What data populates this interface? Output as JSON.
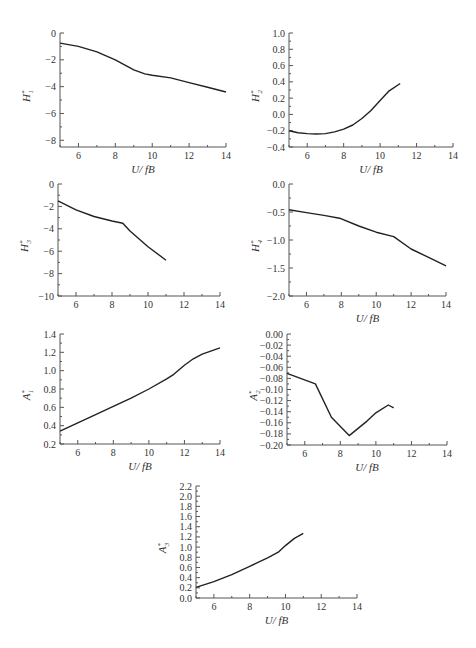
{
  "figure": {
    "xlabel": "U/ fB"
  },
  "chart_data": [
    {
      "id": "H1",
      "type": "line",
      "ylabel": "H*1",
      "ylabel_main": "H",
      "ylabel_sub": "1",
      "xlabel": "U/ fB",
      "xlim": [
        5,
        14
      ],
      "ylim": [
        -8.5,
        0
      ],
      "xticks": [
        6,
        8,
        10,
        12,
        14
      ],
      "yticks": [
        0,
        -2,
        -4,
        -6,
        -8
      ],
      "ytick_labels": [
        "0",
        "-2",
        "-4",
        "-6",
        "-8"
      ],
      "x": [
        5,
        6,
        7,
        8,
        9,
        9.6,
        10,
        11,
        12,
        13,
        14
      ],
      "y": [
        -0.75,
        -1.0,
        -1.4,
        -2.0,
        -2.75,
        -3.05,
        -3.15,
        -3.35,
        -3.7,
        -4.05,
        -4.4
      ],
      "grid": false
    },
    {
      "id": "H2",
      "type": "line",
      "ylabel": "H*2",
      "ylabel_main": "H",
      "ylabel_sub": "2",
      "xlabel": "U/ fB",
      "xlim": [
        5,
        14
      ],
      "ylim": [
        -0.4,
        1.0
      ],
      "xticks": [
        6,
        8,
        10,
        12,
        14
      ],
      "yticks": [
        1.0,
        0.8,
        0.6,
        0.4,
        0.2,
        0.0,
        -0.2,
        -0.4
      ],
      "ytick_labels": [
        "1.0",
        "0.8",
        "0.6",
        "0.4",
        "0.2",
        "0.0",
        "-0.2",
        "-0.4"
      ],
      "x": [
        5,
        5.5,
        6,
        6.5,
        7,
        7.5,
        8,
        8.5,
        9,
        9.5,
        10,
        10.5,
        11.1
      ],
      "y": [
        -0.2,
        -0.225,
        -0.235,
        -0.24,
        -0.235,
        -0.215,
        -0.18,
        -0.13,
        -0.05,
        0.05,
        0.17,
        0.29,
        0.38
      ],
      "grid": false
    },
    {
      "id": "H3",
      "type": "line",
      "ylabel": "H*3",
      "ylabel_main": "H",
      "ylabel_sub": "3",
      "xlabel": "",
      "xlim": [
        5,
        14
      ],
      "ylim": [
        -10,
        0
      ],
      "xticks": [
        6,
        8,
        10,
        12,
        14
      ],
      "yticks": [
        0,
        -2,
        -4,
        -6,
        -8,
        -10
      ],
      "ytick_labels": [
        "0",
        "-2",
        "-4",
        "-6",
        "-8",
        "-10"
      ],
      "x": [
        5,
        6,
        7,
        8,
        8.6,
        9,
        10,
        11
      ],
      "y": [
        -1.5,
        -2.3,
        -2.9,
        -3.3,
        -3.5,
        -4.2,
        -5.6,
        -6.8
      ],
      "grid": false
    },
    {
      "id": "H4",
      "type": "line",
      "ylabel": "H*4",
      "ylabel_main": "H",
      "ylabel_sub": "4",
      "xlabel": "U/ fB",
      "xlim": [
        5,
        14
      ],
      "ylim": [
        -2.0,
        0.0
      ],
      "xticks": [
        6,
        8,
        10,
        12,
        14
      ],
      "yticks": [
        0.0,
        -0.5,
        -1.0,
        -1.5,
        -2.0
      ],
      "ytick_labels": [
        "0.0",
        "-0.5",
        "-1.0",
        "-1.5",
        "-2.0"
      ],
      "x": [
        5,
        6,
        7,
        7.9,
        9,
        10,
        11,
        12,
        13,
        14
      ],
      "y": [
        -0.46,
        -0.51,
        -0.56,
        -0.61,
        -0.75,
        -0.86,
        -0.94,
        -1.16,
        -1.31,
        -1.46
      ],
      "grid": false
    },
    {
      "id": "A1",
      "type": "line",
      "ylabel": "A*1",
      "ylabel_main": "A",
      "ylabel_sub": "1",
      "xlabel": "U/ fB",
      "xlim": [
        5,
        14
      ],
      "ylim": [
        0.2,
        1.4
      ],
      "xticks": [
        6,
        8,
        10,
        12,
        14
      ],
      "yticks": [
        1.4,
        1.2,
        1.0,
        0.8,
        0.6,
        0.4,
        0.2
      ],
      "ytick_labels": [
        "1.4",
        "1.2",
        "1.0",
        "0.8",
        "0.6",
        "0.4",
        "0.2"
      ],
      "x": [
        5,
        6,
        7,
        8,
        9,
        10,
        11,
        11.4,
        12,
        12.5,
        13,
        14
      ],
      "y": [
        0.34,
        0.43,
        0.52,
        0.61,
        0.7,
        0.8,
        0.91,
        0.96,
        1.06,
        1.13,
        1.18,
        1.25
      ],
      "grid": false
    },
    {
      "id": "A2",
      "type": "line",
      "ylabel": "A*2",
      "ylabel_main": "A",
      "ylabel_sub": "2",
      "xlabel": "U/ fB",
      "xlim": [
        5,
        14
      ],
      "ylim": [
        -0.2,
        0.0
      ],
      "xticks": [
        6,
        8,
        10,
        12,
        14
      ],
      "yticks": [
        0.0,
        -0.02,
        -0.04,
        -0.06,
        -0.08,
        -0.1,
        -0.12,
        -0.14,
        -0.16,
        -0.18,
        -0.2
      ],
      "ytick_labels": [
        "0.00",
        "-0.02",
        "-0.04",
        "-0.06",
        "-0.08",
        "-0.10",
        "-0.12",
        "-0.14",
        "-0.16",
        "-0.18",
        "-0.20"
      ],
      "x": [
        5,
        6.6,
        7.5,
        8.5,
        9.5,
        10,
        10.7,
        11
      ],
      "y": [
        -0.071,
        -0.09,
        -0.15,
        -0.183,
        -0.157,
        -0.142,
        -0.128,
        -0.133
      ],
      "grid": false
    },
    {
      "id": "A3",
      "type": "line",
      "ylabel": "A*3",
      "ylabel_main": "A",
      "ylabel_sub": "3",
      "xlabel": "U/ fB",
      "xlim": [
        5,
        14
      ],
      "ylim": [
        0.0,
        2.2
      ],
      "xticks": [
        6,
        8,
        10,
        12,
        14
      ],
      "yticks": [
        2.2,
        2.0,
        1.8,
        1.6,
        1.4,
        1.2,
        1.0,
        0.8,
        0.6,
        0.4,
        0.2,
        0.0
      ],
      "ytick_labels": [
        "2.2",
        "2.0",
        "1.8",
        "1.6",
        "1.4",
        "1.2",
        "1.0",
        "0.8",
        "0.6",
        "0.4",
        "0.2",
        "0.0"
      ],
      "x": [
        5,
        6,
        7,
        8,
        9,
        9.6,
        10,
        10.5,
        11
      ],
      "y": [
        0.21,
        0.32,
        0.46,
        0.62,
        0.79,
        0.9,
        1.03,
        1.17,
        1.27
      ],
      "grid": false
    }
  ]
}
